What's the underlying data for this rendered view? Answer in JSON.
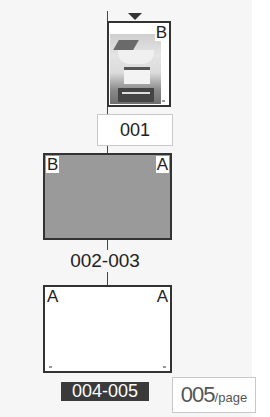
{
  "pages_panel": {
    "current_page_indicator": "triangle-down-icon",
    "pages": [
      {
        "label": "001",
        "layout": "single-right",
        "master_right": "B",
        "thumbnail": "photo-thumbnail",
        "fill": "#ffffff"
      },
      {
        "label": "002-003",
        "layout": "spread",
        "master_left": "B",
        "master_right": "A",
        "fill": "#9a9a9a"
      },
      {
        "label": "004-005",
        "layout": "spread",
        "master_left": "A",
        "master_right": "A",
        "fill": "#ffffff",
        "selected": true
      }
    ],
    "page_count": {
      "value": "005",
      "suffix": "/page"
    }
  },
  "colors": {
    "panel_bg": "#f6f6f6",
    "border": "#333333",
    "selected_label_bg": "#3a3a3a",
    "gray_spread": "#9a9a9a"
  }
}
